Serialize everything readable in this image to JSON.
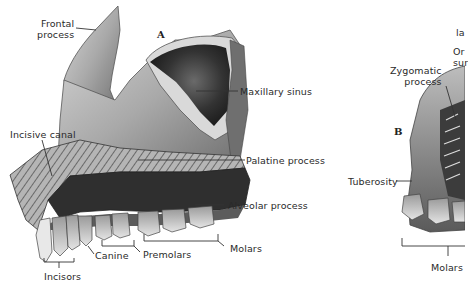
{
  "figure": {
    "panels": [
      {
        "letter": "A",
        "view": "lateral-medial view of maxilla"
      },
      {
        "letter": "B",
        "view": "partial view of maxilla (cropped)"
      }
    ]
  },
  "labels_a": {
    "frontal_process_1": "Frontal",
    "frontal_process_2": "process",
    "maxillary_sinus": "Maxillary sinus",
    "incisive_canal": "Incisive canal",
    "palatine_process": "Palatine process",
    "alveolar_process": "Alveolar process",
    "molars": "Molars",
    "premolars": "Premolars",
    "canine": "Canine",
    "incisors": "Incisors",
    "letter": "A"
  },
  "labels_b": {
    "lacrimal_truncated": "la",
    "orbital_surface_1_truncated": "Or",
    "orbital_surface_2_truncated": "sur",
    "zygomatic_process_1": "Zygomatic",
    "zygomatic_process_2": "process",
    "tuberosity": "Tuberosity",
    "molars": "Molars",
    "letter": "B"
  },
  "colors": {
    "background": "#ffffff",
    "bone_light": "#c9c9c9",
    "bone_mid": "#8f8f8f",
    "bone_dark": "#3a3a3a",
    "sinus": "#2b2b2b",
    "label_text": "#2a2a2a",
    "leader_line": "#333333"
  }
}
